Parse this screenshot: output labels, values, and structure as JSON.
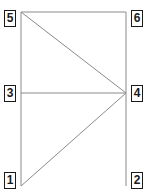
{
  "figure": {
    "kind": "structural-node-diagram",
    "width_px": 153,
    "height_px": 193,
    "background_color": "#ffffff",
    "line_color": "#8a8a8a",
    "line_width_px": 1,
    "label_border_color": "#1a1a1a",
    "label_text_color": "#1a1a1a",
    "label_background_color": "#ffffff"
  },
  "nodes": [
    {
      "id": "node-1",
      "label": "1",
      "x": 21,
      "y": 186,
      "label_x": 4,
      "label_y": 172
    },
    {
      "id": "node-2",
      "label": "2",
      "x": 126,
      "y": 186,
      "label_x": 131,
      "label_y": 172
    },
    {
      "id": "node-3",
      "label": "3",
      "x": 21,
      "y": 93,
      "label_x": 4,
      "label_y": 85
    },
    {
      "id": "node-4",
      "label": "4",
      "x": 126,
      "y": 93,
      "label_x": 131,
      "label_y": 85
    },
    {
      "id": "node-5",
      "label": "5",
      "x": 21,
      "y": 12,
      "label_x": 4,
      "label_y": 10
    },
    {
      "id": "node-6",
      "label": "6",
      "x": 126,
      "y": 12,
      "label_x": 131,
      "label_y": 10
    }
  ],
  "edges": [
    {
      "id": "edge-1-3",
      "from": "node-1",
      "to": "node-3",
      "x1": 21,
      "y1": 186,
      "x2": 21,
      "y2": 93
    },
    {
      "id": "edge-3-5",
      "from": "node-3",
      "to": "node-5",
      "x1": 21,
      "y1": 93,
      "x2": 21,
      "y2": 12
    },
    {
      "id": "edge-2-4",
      "from": "node-2",
      "to": "node-4",
      "x1": 126,
      "y1": 186,
      "x2": 126,
      "y2": 93
    },
    {
      "id": "edge-4-6",
      "from": "node-4",
      "to": "node-6",
      "x1": 126,
      "y1": 93,
      "x2": 126,
      "y2": 12
    },
    {
      "id": "edge-5-6",
      "from": "node-5",
      "to": "node-6",
      "x1": 21,
      "y1": 12,
      "x2": 126,
      "y2": 12
    },
    {
      "id": "edge-3-4",
      "from": "node-3",
      "to": "node-4",
      "x1": 21,
      "y1": 93,
      "x2": 126,
      "y2": 93
    },
    {
      "id": "edge-5-4",
      "from": "node-5",
      "to": "node-4",
      "x1": 21,
      "y1": 12,
      "x2": 126,
      "y2": 93
    },
    {
      "id": "edge-1-4",
      "from": "node-1",
      "to": "node-4",
      "x1": 21,
      "y1": 186,
      "x2": 126,
      "y2": 93
    }
  ]
}
